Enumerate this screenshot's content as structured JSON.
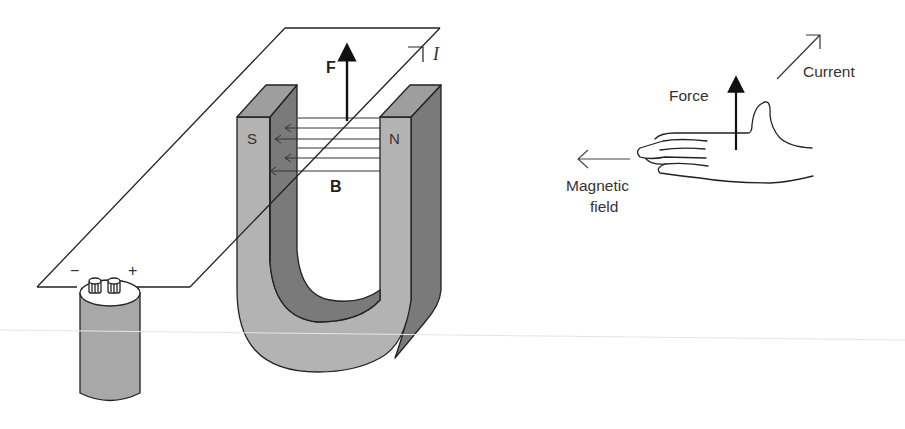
{
  "figure": {
    "colors": {
      "background": "#ffffff",
      "ink": "#222222",
      "magnet_light": "#b3b3b3",
      "magnet_dark": "#7a7a7a",
      "magnet_top": "#9e9e9e",
      "battery_body": "#a8a8a8",
      "battery_top": "#ffffff"
    }
  },
  "apparatus": {
    "magnet": {
      "south_pole_label": "S",
      "north_pole_label": "N"
    },
    "force_label": "F",
    "field_label": "B",
    "current_label": "I",
    "battery": {
      "negative_label": "−",
      "positive_label": "+"
    }
  },
  "right_hand_rule": {
    "force_label": "Force",
    "current_label": "Current",
    "field_label_line1": "Magnetic",
    "field_label_line2": "field"
  }
}
